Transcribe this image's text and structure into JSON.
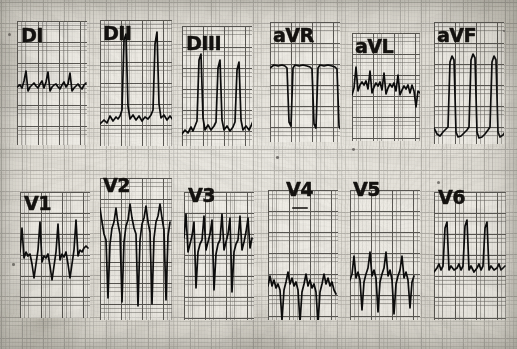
{
  "document": {
    "kind": "12-lead electrocardiogram",
    "media": "scanned grid paper strip",
    "width_px": 517,
    "height_px": 349,
    "paper_color": "#e2dfd7",
    "grid_minor_color": "#5f5d58",
    "grid_major_color": "#373532",
    "trace_color": "#0d0c0a"
  },
  "rows": [
    {
      "name": "limb-leads-row",
      "leads": [
        "DI",
        "DII",
        "DIII",
        "aVR",
        "aVL",
        "aVF"
      ]
    },
    {
      "name": "precordial-leads-row",
      "leads": [
        "V1",
        "V2",
        "V3",
        "V4",
        "V5",
        "V6"
      ]
    }
  ],
  "leads": [
    {
      "id": "DI",
      "label": "DI",
      "row": 0,
      "panel": {
        "x": 17,
        "y": 21,
        "w": 70,
        "h": 124
      },
      "label_pos": {
        "x": 4,
        "y": 5
      },
      "beats": 4,
      "baseline_y": 66,
      "qrs_polarity": "positive-small",
      "description": "Low amplitude positive QRS complexes with small r waves on an undulating baseline",
      "trace": "M0,66 L3,64 L5,67 L7,60 L9,50 L11,70 L13,66 L15,64 L17,62 L19,65 L21,67 L23,63 L25,60 L27,67 L29,61 L31,51 L33,70 L35,66 L37,64 L39,63 L41,66 L43,68 L45,64 L47,61 L49,66 L51,63 L53,52 L55,70 L57,67 L59,65 L61,63 L63,66 L65,68 L67,64 L69,62"
    },
    {
      "id": "DII",
      "label": "DII",
      "row": 0,
      "panel": {
        "x": 100,
        "y": 20,
        "w": 72,
        "h": 126
      },
      "label_pos": {
        "x": 3,
        "y": 4
      },
      "beats": 3,
      "baseline_y": 97,
      "qrs_polarity": "tall-positive",
      "description": "Tall narrow R waves reaching the top of the strip with a low baseline",
      "trace": "M0,104 L4,100 L7,103 L10,96 L13,101 L16,97 L18,99 L20,96 L22,90 L24,20 L26,14 L28,86 L30,99 L33,95 L36,100 L39,96 L42,101 L45,97 L48,99 L51,95 L53,90 L55,24 L57,12 L59,84 L61,98 L64,95 L67,100 L70,96 L73,100 L76,97 L79,99 L82,95 L84,88 L86,26 L88,14 L90,84 L92,99 L95,92 L97,102 L99,93 L101,101 L103,95"
    },
    {
      "id": "DIII",
      "label": "DIII",
      "row": 0,
      "panel": {
        "x": 182,
        "y": 26,
        "w": 70,
        "h": 120
      },
      "label_pos": {
        "x": 4,
        "y": 8
      },
      "beats": 4,
      "baseline_y": 100,
      "qrs_polarity": "tall-positive",
      "description": "Tall spiky R waves with a low wandering baseline",
      "trace": "M0,108 L3,104 L6,107 L9,101 L11,105 L13,100 L15,95 L17,34 L19,28 L21,92 L23,104 L26,99 L29,104 L32,100 L34,96 L36,42 L38,34 L40,94 L42,104 L45,100 L48,105 L51,101 L53,96 L55,44 L57,36 L59,94 L61,104 L64,100 L67,104 L69,100 L71,95 L73,38 L75,30"
    },
    {
      "id": "aVR",
      "label": "aVR",
      "row": 0,
      "panel": {
        "x": 270,
        "y": 22,
        "w": 70,
        "h": 120
      },
      "label_pos": {
        "x": 3,
        "y": 4
      },
      "beats": 3,
      "baseline_y": 44,
      "qrs_polarity": "deep-negative",
      "description": "Flat upper baseline with deep narrow downward QS deflections",
      "trace": "M0,46 L4,43 L8,44 L12,43 L15,44 L17,46 L19,100 L21,104 L23,46 L25,43 L29,44 L33,43 L37,44 L40,45 L42,47 L44,102 L46,106 L48,46 L50,43 L54,44 L58,43 L62,44 L65,45 L67,47 L69,104 L71,108 L73,46 L75,42 L79,44 L83,43 L86,46 L88,44"
    },
    {
      "id": "aVL",
      "label": "aVL",
      "row": 0,
      "panel": {
        "x": 352,
        "y": 33,
        "w": 68,
        "h": 108
      },
      "label_pos": {
        "x": 3,
        "y": 4
      },
      "beats": 4,
      "baseline_y": 50,
      "qrs_polarity": "positive-small",
      "description": "Small notched positive complexes with a descending terminal segment",
      "trace": "M0,62 L2,55 L4,34 L6,58 L8,52 L10,49 L12,52 L14,48 L16,56 L18,38 L20,60 L22,54 L24,50 L26,53 L28,49 L30,57 L32,40 L34,61 L36,55 L38,51 L40,54 L42,50 L44,58 L46,42 L48,62 L50,57 L52,53 L54,56 L56,52 L58,60 L60,52 L62,58 L64,74 L66,58 L68,60"
    },
    {
      "id": "aVF",
      "label": "aVF",
      "row": 0,
      "panel": {
        "x": 434,
        "y": 22,
        "w": 70,
        "h": 122
      },
      "label_pos": {
        "x": 3,
        "y": 4
      },
      "beats": 3,
      "baseline_y": 104,
      "qrs_polarity": "tall-positive",
      "description": "Very tall thin R spikes rising from a deep negative baseline trough",
      "trace": "M0,106 L3,112 L6,114 L9,110 L12,107 L14,105 L16,40 L18,34 L20,38 L22,110 L24,115 L27,114 L30,111 L33,108 L35,105 L37,38 L39,32 L41,36 L43,110 L45,116 L48,115 L51,112 L54,108 L56,105 L58,40 L60,34 L62,38 L64,110 L66,115 L69,113 L71,110 L73,106"
    },
    {
      "id": "V1",
      "label": "V1",
      "row": 1,
      "panel": {
        "x": 20,
        "y": 192,
        "w": 70,
        "h": 126
      },
      "label_pos": {
        "x": 4,
        "y": 2
      },
      "beats": 4,
      "baseline_y": 62,
      "qrs_polarity": "rS",
      "description": "Thin pacing-like spikes followed by small r waves and negative S deflections",
      "trace": "M0,60 L2,36 L4,66 L6,60 L8,64 L10,62 L12,72 L14,86 L16,72 L18,58 L20,30 L22,70 L24,64 L26,66 L28,62 L30,74 L32,88 L34,74 L36,60 L38,32 L40,68 L42,62 L44,65 L46,60 L48,72 L50,86 L52,72 L54,58 L56,28 L58,64 L60,58 L62,60 L64,56 L66,54 L68,56"
    },
    {
      "id": "V2",
      "label": "V2",
      "row": 1,
      "panel": {
        "x": 100,
        "y": 178,
        "w": 72,
        "h": 142
      },
      "label_pos": {
        "x": 3,
        "y": -2
      },
      "beats": 4,
      "baseline_y": 42,
      "qrs_polarity": "RS-deep",
      "description": "Sharp R peaks at the top with very deep S waves plunging toward the bottom of the panel",
      "trace": "M0,30 L2,44 L4,56 L6,62 L8,120 L10,66 L12,50 L14,44 L16,30 L18,46 L20,56 L22,124 L24,64 L26,48 L28,42 L30,26 L32,40 L34,50 L36,56 L38,128 L40,62 L42,46 L44,40 L46,28 L48,44 L50,54 L52,126 L54,60 L56,44 L58,38 L60,26 L62,40 L64,52 L66,122 L68,58 L70,44"
    },
    {
      "id": "V3",
      "label": "V3",
      "row": 1,
      "panel": {
        "x": 184,
        "y": 192,
        "w": 70,
        "h": 128
      },
      "label_pos": {
        "x": 4,
        "y": -6
      },
      "beats": 4,
      "baseline_y": 52,
      "qrs_polarity": "RS-deep",
      "description": "Pacing spikes above, sharp R waves and deep downward S strokes reaching low in the panel",
      "trace": "M0,46 L2,22 L4,60 L6,52 L8,44 L10,30 L12,96 L14,60 L16,52 L18,48 L20,24 L22,58 L24,50 L26,42 L28,28 L30,98 L32,62 L34,52 L36,48 L38,22 L40,58 L42,50 L44,42 L46,26 L48,100 L50,60 L52,52 L54,48 L56,24 L58,58 L60,50 L62,40 L64,26 L66,56 L68,46"
    },
    {
      "id": "V4",
      "label": "V4",
      "row": 1,
      "panel": {
        "x": 268,
        "y": 190,
        "w": 70,
        "h": 130
      },
      "label_pos": {
        "x": 18,
        "y": -10
      },
      "beats": 4,
      "baseline_y": 92,
      "qrs_polarity": "rS-deep",
      "description": "Low-placed trace with small notched R waves and very deep S waves near the bottom",
      "trace": "M0,96 L2,86 L4,96 L6,90 L8,98 L10,94 L12,100 L14,130 L16,100 L18,92 L20,82 L22,94 L24,88 L26,96 L28,92 L30,100 L32,132 L34,102 L36,94 L38,84 L40,96 L42,90 L44,98 L46,94 L48,102 L50,134 L52,102 L54,94 L56,84 L58,94 L60,88 L62,96 L64,92 L66,100 L68,104"
    },
    {
      "id": "V5",
      "label": "V5",
      "row": 1,
      "panel": {
        "x": 350,
        "y": 190,
        "w": 70,
        "h": 130
      },
      "label_pos": {
        "x": 3,
        "y": -10
      },
      "beats": 4,
      "baseline_y": 84,
      "qrs_polarity": "RS",
      "description": "Peaked R waves with deep S waves descending below the baseline",
      "trace": "M0,90 L2,84 L4,66 L6,88 L8,82 L10,90 L12,120 L14,92 L16,84 L18,78 L20,62 L22,86 L24,80 L26,88 L28,122 L30,92 L32,84 L34,78 L36,62 L38,86 L40,80 L42,90 L44,124 L46,94 L48,86 L50,80 L52,66 L54,88 L56,82 L58,90 L60,118 L62,92 L64,86"
    },
    {
      "id": "V6",
      "label": "V6",
      "row": 1,
      "panel": {
        "x": 434,
        "y": 192,
        "w": 72,
        "h": 128
      },
      "label_pos": {
        "x": 4,
        "y": -4
      },
      "beats": 4,
      "baseline_y": 76,
      "qrs_polarity": "positive-spike",
      "description": "Tall narrow spikes over a nearly flat baseline with small notches",
      "trace": "M0,80 L3,76 L5,72 L7,78 L9,74 L11,36 L13,30 L15,78 L17,74 L20,78 L23,76 L25,72 L27,78 L29,74 L31,34 L33,28 L35,78 L37,74 L40,80 L43,76 L45,72 L47,78 L49,74 L51,36 L53,30 L55,78 L57,74 L60,78 L63,76 L65,72 L67,78 L69,76 L71,74"
    }
  ],
  "artifacts": {
    "ink_specks": [
      {
        "x": 8,
        "y": 33,
        "r": 1.6
      },
      {
        "x": 437,
        "y": 181,
        "r": 1.5
      },
      {
        "x": 352,
        "y": 148,
        "r": 1.4
      },
      {
        "x": 12,
        "y": 263,
        "r": 1.3
      },
      {
        "x": 276,
        "y": 156,
        "r": 1.3
      },
      {
        "x": 503,
        "y": 30,
        "r": 1.2
      }
    ],
    "v4_pen_mark": {
      "x": 292,
      "y": 207,
      "w": 16,
      "h": 2
    }
  }
}
